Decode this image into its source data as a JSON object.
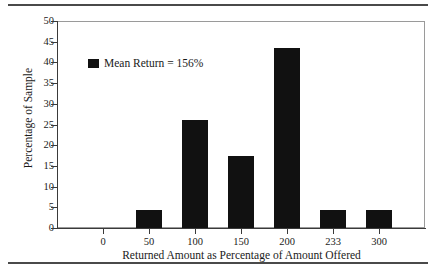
{
  "chart_data": {
    "type": "bar",
    "title": "",
    "xlabel": "Returned Amount as Percentage of Amount Offered",
    "ylabel": "Percentage of Sample",
    "categories": [
      "0",
      "50",
      "100",
      "150",
      "200",
      "233",
      "300"
    ],
    "values": [
      0,
      4.3,
      26,
      17.3,
      43.5,
      4.3,
      4.3
    ],
    "ylim": [
      0,
      50
    ],
    "yticks": [
      0,
      5,
      10,
      15,
      20,
      25,
      30,
      35,
      40,
      45,
      50
    ],
    "ytick_labels": [
      "0",
      "5",
      "10",
      "15",
      "20",
      "25",
      "30",
      "35",
      "40",
      "45",
      "50"
    ],
    "grid": false,
    "legend": {
      "position": "upper-left-inside",
      "entries": [
        {
          "label": "Mean Return = 156%",
          "marker": "filled-square",
          "color": "#111111"
        }
      ]
    },
    "bar_color": "#111111",
    "axis_color": "#3a3a3a",
    "frame_color": "#9a9a9a",
    "rule_color": "#4a4a4a",
    "background": "#ffffff"
  }
}
